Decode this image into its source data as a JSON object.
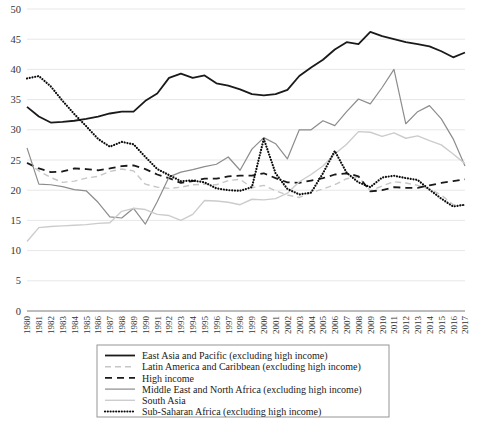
{
  "chart_data": {
    "type": "line",
    "title": "",
    "xlabel": "",
    "ylabel": "",
    "ylim": [
      0,
      50
    ],
    "yticks": [
      0,
      5,
      10,
      15,
      20,
      25,
      30,
      35,
      40,
      45,
      50
    ],
    "grid": true,
    "legend_position": "bottom",
    "categories": [
      "1980",
      "1981",
      "1982",
      "1983",
      "1984",
      "1985",
      "1986",
      "1987",
      "1988",
      "1989",
      "1990",
      "1991",
      "1992",
      "1993",
      "1994",
      "1995",
      "1996",
      "1997",
      "1998",
      "1999",
      "2000",
      "2001",
      "2002",
      "2003",
      "2004",
      "2005",
      "2006",
      "2007",
      "2008",
      "2009",
      "2010",
      "2011",
      "2012",
      "2013",
      "2014",
      "2015",
      "2016",
      "2017"
    ],
    "series": [
      {
        "name": "East Asia and Pacific (excluding high income)",
        "style": "solid",
        "color": "#1a1a1a",
        "width": 1.8,
        "values": [
          33.8,
          32.2,
          31.2,
          31.3,
          31.5,
          31.8,
          32.2,
          32.7,
          33.0,
          33.0,
          34.8,
          36.0,
          38.6,
          39.3,
          38.6,
          39.0,
          37.7,
          37.3,
          36.7,
          35.9,
          35.7,
          35.9,
          36.6,
          38.9,
          40.3,
          41.6,
          43.3,
          44.5,
          44.2,
          46.2,
          45.5,
          45.0,
          44.5,
          44.2,
          43.8,
          43.0,
          42.0,
          42.8
        ]
      },
      {
        "name": "Latin America and Caribbean (excluding high income)",
        "style": "dashed-light",
        "color": "#c6c6c6",
        "width": 1.4,
        "values": [
          24.6,
          23.2,
          22.1,
          21.3,
          21.5,
          22.0,
          22.3,
          23.1,
          23.5,
          23.2,
          21.0,
          20.5,
          20.3,
          20.5,
          20.9,
          21.0,
          20.9,
          21.6,
          21.8,
          20.4,
          20.8,
          19.9,
          19.2,
          18.8,
          19.6,
          20.2,
          20.9,
          21.9,
          22.2,
          19.9,
          20.7,
          21.4,
          21.2,
          20.8,
          20.2,
          19.2,
          17.6,
          17.5
        ]
      },
      {
        "name": "High income",
        "style": "dashed-dark",
        "color": "#1a1a1a",
        "width": 1.8,
        "values": [
          24.5,
          23.6,
          23.0,
          23.1,
          23.6,
          23.5,
          23.3,
          23.6,
          24.0,
          24.1,
          23.5,
          22.6,
          22.0,
          21.2,
          21.5,
          21.9,
          21.9,
          22.3,
          22.4,
          22.4,
          22.8,
          22.0,
          21.3,
          21.2,
          21.6,
          22.0,
          22.6,
          22.8,
          22.3,
          19.8,
          20.0,
          20.5,
          20.4,
          20.4,
          20.8,
          21.2,
          21.5,
          21.8
        ]
      },
      {
        "name": "Middle East and North Africa (excluding high income)",
        "style": "solid-gray",
        "color": "#8c8c8c",
        "width": 1.2,
        "values": [
          27.0,
          21.0,
          20.9,
          20.6,
          20.1,
          19.9,
          18.0,
          15.6,
          15.4,
          17.0,
          14.4,
          18.1,
          22.2,
          23.0,
          23.4,
          23.9,
          24.3,
          25.5,
          23.3,
          26.8,
          28.7,
          27.7,
          25.2,
          30.0,
          30.0,
          31.5,
          30.7,
          33.0,
          35.1,
          34.3,
          37.0,
          40.0,
          31.0,
          33.0,
          34.0,
          31.8,
          28.5,
          24.0
        ]
      },
      {
        "name": "South Asia",
        "style": "solid-light",
        "color": "#cccccc",
        "width": 1.4,
        "values": [
          11.5,
          13.8,
          14.0,
          14.1,
          14.2,
          14.3,
          14.5,
          14.6,
          16.5,
          17.0,
          16.8,
          16.0,
          15.8,
          15.0,
          16.0,
          18.3,
          18.2,
          18.0,
          17.6,
          18.5,
          18.4,
          18.6,
          19.5,
          21.4,
          22.6,
          24.0,
          26.0,
          27.6,
          29.7,
          29.6,
          28.9,
          29.5,
          28.6,
          29.0,
          28.2,
          27.5,
          26.0,
          24.4
        ]
      },
      {
        "name": "Sub-Saharan Africa (excluding high income)",
        "style": "dotted",
        "color": "#0d0d0d",
        "width": 2.2,
        "values": [
          38.5,
          38.9,
          37.2,
          34.8,
          32.6,
          30.6,
          28.5,
          27.2,
          28.0,
          27.6,
          25.5,
          23.5,
          22.5,
          21.5,
          21.6,
          21.3,
          20.3,
          20.0,
          19.9,
          20.5,
          28.5,
          22.8,
          20.2,
          19.3,
          19.6,
          22.8,
          26.5,
          22.9,
          21.3,
          20.5,
          22.1,
          22.4,
          22.0,
          21.7,
          20.1,
          18.6,
          17.3,
          17.6
        ]
      }
    ]
  },
  "legend": {
    "items": [
      {
        "label": "East Asia and Pacific (excluding high income)"
      },
      {
        "label": "Latin America and Caribbean (excluding high income)"
      },
      {
        "label": "High income"
      },
      {
        "label": "Middle East and North Africa (excluding high income)"
      },
      {
        "label": "South Asia"
      },
      {
        "label": "Sub-Saharan Africa (excluding high income)"
      }
    ]
  }
}
